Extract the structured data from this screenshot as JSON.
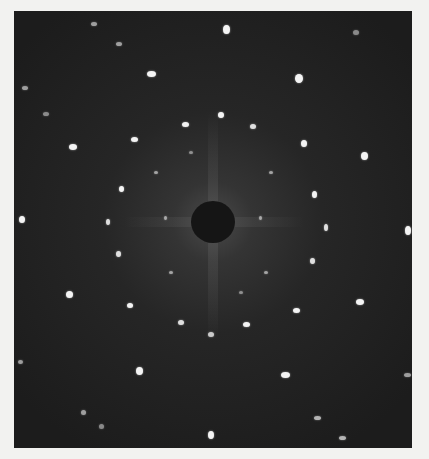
{
  "image": {
    "subject": "X-ray diffraction (Laue) pattern photograph",
    "background_color": "#f2f2f0",
    "plate_color": "#1e1e1e",
    "spot_color": "#f4f4f4",
    "beamstop": {
      "cx": 199,
      "cy": 211,
      "rx": 22,
      "ry": 21,
      "color": "#151515"
    },
    "spots": [
      {
        "x": 209,
        "y": 14,
        "w": 7,
        "h": 9,
        "o": 1
      },
      {
        "x": 133,
        "y": 60,
        "w": 9,
        "h": 6,
        "o": 1
      },
      {
        "x": 281,
        "y": 63,
        "w": 8,
        "h": 9,
        "o": 1
      },
      {
        "x": 77,
        "y": 11,
        "w": 6,
        "h": 4,
        "o": 0.6
      },
      {
        "x": 102,
        "y": 31,
        "w": 6,
        "h": 4,
        "o": 0.6
      },
      {
        "x": 339,
        "y": 19,
        "w": 6,
        "h": 5,
        "o": 0.5
      },
      {
        "x": 8,
        "y": 75,
        "w": 6,
        "h": 4,
        "o": 0.6
      },
      {
        "x": 29,
        "y": 101,
        "w": 6,
        "h": 4,
        "o": 0.5
      },
      {
        "x": 55,
        "y": 133,
        "w": 8,
        "h": 6,
        "o": 1
      },
      {
        "x": 168,
        "y": 111,
        "w": 7,
        "h": 5,
        "o": 1
      },
      {
        "x": 204,
        "y": 101,
        "w": 6,
        "h": 6,
        "o": 1
      },
      {
        "x": 236,
        "y": 113,
        "w": 6,
        "h": 5,
        "o": 0.9
      },
      {
        "x": 117,
        "y": 126,
        "w": 7,
        "h": 5,
        "o": 1
      },
      {
        "x": 287,
        "y": 129,
        "w": 6,
        "h": 7,
        "o": 1
      },
      {
        "x": 347,
        "y": 141,
        "w": 7,
        "h": 8,
        "o": 1
      },
      {
        "x": 105,
        "y": 175,
        "w": 5,
        "h": 6,
        "o": 1
      },
      {
        "x": 298,
        "y": 180,
        "w": 5,
        "h": 7,
        "o": 1
      },
      {
        "x": 5,
        "y": 205,
        "w": 6,
        "h": 7,
        "o": 1
      },
      {
        "x": 391,
        "y": 215,
        "w": 6,
        "h": 9,
        "o": 1
      },
      {
        "x": 92,
        "y": 208,
        "w": 4,
        "h": 6,
        "o": 0.9
      },
      {
        "x": 310,
        "y": 213,
        "w": 4,
        "h": 7,
        "o": 0.9
      },
      {
        "x": 102,
        "y": 240,
        "w": 5,
        "h": 6,
        "o": 0.9
      },
      {
        "x": 296,
        "y": 247,
        "w": 5,
        "h": 6,
        "o": 0.9
      },
      {
        "x": 52,
        "y": 280,
        "w": 7,
        "h": 7,
        "o": 1
      },
      {
        "x": 342,
        "y": 288,
        "w": 8,
        "h": 6,
        "o": 1
      },
      {
        "x": 113,
        "y": 292,
        "w": 6,
        "h": 5,
        "o": 1
      },
      {
        "x": 279,
        "y": 297,
        "w": 7,
        "h": 5,
        "o": 1
      },
      {
        "x": 164,
        "y": 309,
        "w": 6,
        "h": 5,
        "o": 0.9
      },
      {
        "x": 229,
        "y": 311,
        "w": 7,
        "h": 5,
        "o": 1
      },
      {
        "x": 194,
        "y": 321,
        "w": 6,
        "h": 5,
        "o": 0.8
      },
      {
        "x": 122,
        "y": 356,
        "w": 7,
        "h": 8,
        "o": 1
      },
      {
        "x": 267,
        "y": 361,
        "w": 9,
        "h": 6,
        "o": 1
      },
      {
        "x": 4,
        "y": 349,
        "w": 5,
        "h": 4,
        "o": 0.6
      },
      {
        "x": 390,
        "y": 362,
        "w": 7,
        "h": 4,
        "o": 0.6
      },
      {
        "x": 67,
        "y": 399,
        "w": 5,
        "h": 5,
        "o": 0.6
      },
      {
        "x": 194,
        "y": 420,
        "w": 6,
        "h": 8,
        "o": 1
      },
      {
        "x": 300,
        "y": 405,
        "w": 7,
        "h": 4,
        "o": 0.7
      },
      {
        "x": 325,
        "y": 425,
        "w": 7,
        "h": 4,
        "o": 0.7
      },
      {
        "x": 85,
        "y": 413,
        "w": 5,
        "h": 5,
        "o": 0.5
      },
      {
        "x": 150,
        "y": 205,
        "w": 3,
        "h": 4,
        "o": 0.6
      },
      {
        "x": 245,
        "y": 205,
        "w": 3,
        "h": 4,
        "o": 0.6
      },
      {
        "x": 140,
        "y": 160,
        "w": 4,
        "h": 3,
        "o": 0.6
      },
      {
        "x": 250,
        "y": 260,
        "w": 4,
        "h": 3,
        "o": 0.6
      },
      {
        "x": 155,
        "y": 260,
        "w": 4,
        "h": 3,
        "o": 0.6
      },
      {
        "x": 255,
        "y": 160,
        "w": 4,
        "h": 3,
        "o": 0.6
      },
      {
        "x": 175,
        "y": 140,
        "w": 4,
        "h": 3,
        "o": 0.5
      },
      {
        "x": 225,
        "y": 280,
        "w": 4,
        "h": 3,
        "o": 0.5
      }
    ]
  }
}
